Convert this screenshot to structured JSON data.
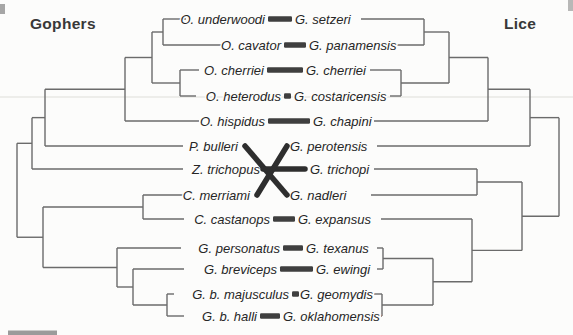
{
  "figure": {
    "left_heading": "Gophers",
    "right_heading": "Lice",
    "rows": [
      {
        "host": "O. underwoodi",
        "parasite": "G. setzeri",
        "association": "bar"
      },
      {
        "host": "O. cavator",
        "parasite": "G. panamensis",
        "association": "bar"
      },
      {
        "host": "O. cherriei",
        "parasite": "G. cherriei",
        "association": "bar"
      },
      {
        "host": "O. heterodus",
        "parasite": "G. costaricensis",
        "association": "square"
      },
      {
        "host": "O. hispidus",
        "parasite": "G. chapini",
        "association": "bar"
      },
      {
        "host": "P. bulleri",
        "parasite": "G. perotensis",
        "association": "cross"
      },
      {
        "host": "Z. trichopus",
        "parasite": "G. trichopi",
        "association": "cross"
      },
      {
        "host": "C. merriami",
        "parasite": "G. nadleri",
        "association": "cross"
      },
      {
        "host": "C. castanops",
        "parasite": "G. expansus",
        "association": "bar"
      },
      {
        "host": "G. personatus",
        "parasite": "G. texanus",
        "association": "bar"
      },
      {
        "host": "G. breviceps",
        "parasite": "G. ewingi",
        "association": "bar"
      },
      {
        "host": "G. b. majusculus",
        "parasite": "G. geomydis",
        "association": "square"
      },
      {
        "host": "G. b. halli",
        "parasite": "G. oklahomensis",
        "association": "bar"
      }
    ],
    "cross_links": [
      {
        "host": "P. bulleri",
        "parasite": "G. nadleri"
      },
      {
        "host": "Z. trichopus",
        "parasite": "G. trichopi"
      },
      {
        "host": "C. merriami",
        "parasite": "G. perotensis"
      }
    ],
    "host_tree": {
      "x": 17,
      "children": [
        {
          "x": 32,
          "children": [
            {
              "x": 45,
              "children": [
                {
                  "x": 125,
                  "children": [
                    {
                      "x": 152,
                      "children": [
                        {
                          "x": 163,
                          "children": [
                            0,
                            1
                          ]
                        },
                        {
                          "x": 180,
                          "children": [
                            2,
                            3
                          ]
                        }
                      ]
                    },
                    4
                  ]
                },
                5
              ]
            },
            6
          ]
        },
        {
          "x": 43,
          "children": [
            {
              "x": 143,
              "children": [
                7,
                8
              ]
            },
            {
              "x": 117,
              "children": [
                9,
                {
                  "x": 133,
                  "children": [
                    10,
                    {
                      "x": 167,
                      "children": [
                        11,
                        12
                      ]
                    }
                  ]
                }
              ]
            }
          ]
        }
      ]
    },
    "parasite_tree": {
      "x": 559,
      "children": [
        {
          "x": 530,
          "children": [
            {
              "x": 488,
              "children": [
                {
                  "x": 449,
                  "children": [
                    {
                      "x": 424,
                      "children": [
                        0,
                        1
                      ]
                    },
                    {
                      "x": 401,
                      "children": [
                        2,
                        3
                      ]
                    }
                  ]
                },
                4
              ]
            },
            5
          ]
        },
        {
          "x": 522,
          "children": [
            {
              "x": 477,
              "children": [
                6,
                7
              ]
            },
            {
              "x": 472,
              "children": [
                8,
                {
                  "x": 433,
                  "children": [
                    {
                      "x": 383,
                      "children": [
                        9,
                        10
                      ]
                    },
                    {
                      "x": 382,
                      "children": [
                        11,
                        12
                      ]
                    }
                  ]
                }
              ]
            }
          ]
        }
      ]
    },
    "colors": {
      "background": "#fcfcfb",
      "tree_line": "#6b6b6b",
      "label_text": "#262626",
      "heading_text": "#383838",
      "association_bar": "#3f3f3f",
      "association_cross": "#2e2e2e",
      "scan_line": "#e8e8e4",
      "scale_fragment": "#9b9b9b"
    }
  }
}
